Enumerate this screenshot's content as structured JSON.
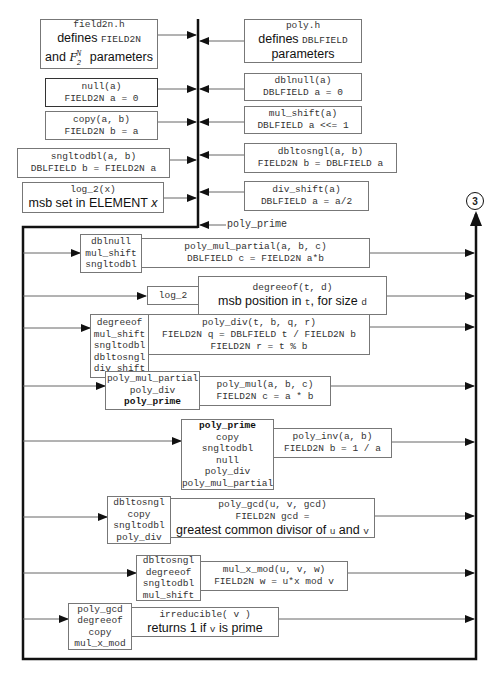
{
  "header_files": {
    "field2n": {
      "title": "field2n.h",
      "desc_prefix": "defines ",
      "desc_code": "FIELD2N",
      "line2_prefix": "and ",
      "line2_math": "F",
      "line2_sub": "2",
      "line2_sup": "N",
      "line2_suffix": " parameters"
    },
    "poly": {
      "title": "poly.h",
      "desc_prefix": "defines ",
      "desc_code": "DBLFIELD",
      "line2": "parameters"
    }
  },
  "left_primitives": [
    {
      "name": "null(a)",
      "desc": "FIELD2N a = 0"
    },
    {
      "name": "copy(a, b)",
      "desc": "FIELD2N b = a"
    },
    {
      "name": "sngltodbl(a, b)",
      "desc": "DBLFIELD b = FIELD2N a"
    },
    {
      "name": "log_2(x)",
      "desc_prefix": "msb set in ELEMENT ",
      "desc_var": "x"
    }
  ],
  "right_primitives": [
    {
      "name": "dblnull(a)",
      "desc": "DBLFIELD a = 0"
    },
    {
      "name": "mul_shift(a)",
      "desc": "DBLFIELD a <<= 1"
    },
    {
      "name": "dbltosngl(a, b)",
      "desc": "FIELD2N b = DBLFIELD a"
    },
    {
      "name": "div_shift(a)",
      "desc": "DBLFIELD a = a/2"
    }
  ],
  "bus_input_label": "poly_prime",
  "connector": {
    "label": "3"
  },
  "functions": [
    {
      "deps": [
        "dblnull",
        "mul_shift",
        "sngltodbl"
      ],
      "name": "poly_mul_partial(a, b, c)",
      "desc": [
        "DBLFIELD c = FIELD2N a*b"
      ]
    },
    {
      "deps": [
        "log_2"
      ],
      "name": "degreeof(t, d)",
      "desc_prefix": "msb position in ",
      "desc_var1": "t",
      "desc_mid": ", for size ",
      "desc_var2": "d"
    },
    {
      "deps": [
        "degreeof",
        "mul_shift",
        "sngltodbl",
        "dbltosngl",
        "div_shift"
      ],
      "name": "poly_div(t, b, q, r)",
      "desc": [
        "FIELD2N q = DBLFIELD t / FIELD2N b",
        "FIELD2N r = t % b"
      ]
    },
    {
      "deps": [
        "poly_mul_partial",
        "poly_div",
        "poly_prime"
      ],
      "bold_dep": "poly_prime",
      "name": "poly_mul(a, b, c)",
      "desc": [
        "FIELD2N c = a * b"
      ]
    },
    {
      "deps": [
        "poly_prime",
        "copy",
        "sngltodbl",
        "null",
        "poly_div",
        "poly_mul_partial"
      ],
      "bold_dep": "poly_prime",
      "name": "poly_inv(a, b)",
      "desc": [
        "FIELD2N b = 1 / a"
      ]
    },
    {
      "deps": [
        "dbltosngl",
        "copy",
        "sngltodbl",
        "poly_div"
      ],
      "name": "poly_gcd(u, v, gcd)",
      "desc": [
        "FIELD2N gcd ="
      ],
      "desc2_prefix": "greatest common divisor of ",
      "desc2_var1": "u",
      "desc2_mid": " and ",
      "desc2_var2": "v"
    },
    {
      "deps": [
        "dbltosngl",
        "degreeof",
        "sngltodbl",
        "mul_shift"
      ],
      "name": "mul_x_mod(u, v, w)",
      "desc": [
        "FIELD2N w = u*x mod v"
      ]
    },
    {
      "deps": [
        "poly_gcd",
        "degreeof",
        "copy",
        "mul_x_mod"
      ],
      "name": "irreducible( v )",
      "desc_prefix": "returns 1 if ",
      "desc_var": "v",
      "desc_suffix": " is prime"
    }
  ],
  "colors": {
    "line": "#111111",
    "thin_line": "#666666",
    "box_border": "#777777"
  }
}
